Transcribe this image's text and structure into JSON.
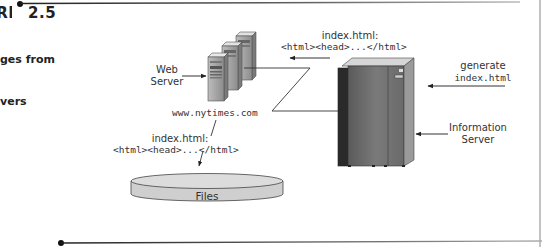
{
  "figure": {
    "label": "FIGURE",
    "number": "2.5",
    "caption_lines": [
      "ges from",
      "vers"
    ]
  },
  "diagram": {
    "web_server": {
      "label_line1": "Web",
      "label_line2": "Server",
      "hostname": "www.nytimes.com"
    },
    "transfer_to_web_server": {
      "filename": "index.html:",
      "content": "<html><head>...</html>"
    },
    "transfer_to_files": {
      "filename": "index.html:",
      "content": "<html><head>...</html>"
    },
    "generate": {
      "line1": "generate",
      "line2": "index.html"
    },
    "information_server": {
      "label_line1": "Information",
      "label_line2": "Server"
    },
    "files": {
      "label": "Files"
    }
  },
  "colors": {
    "rule": "#555555",
    "files_fill": "#d4d4d4",
    "server_body": "#8a8a8a",
    "mainframe_body": "#6e6e6e"
  }
}
